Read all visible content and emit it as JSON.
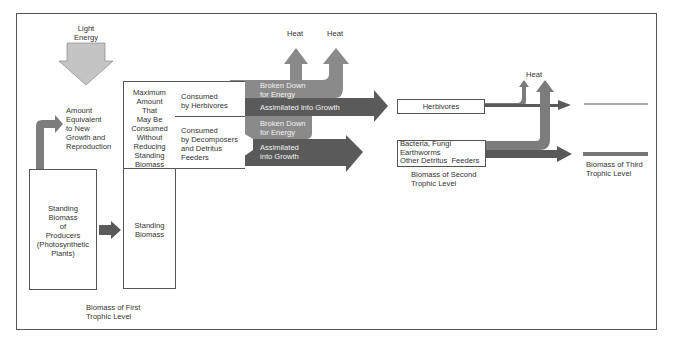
{
  "colors": {
    "light_arrow": "#c4c4c4",
    "broken_down_arrow": "#8a8a8a",
    "assimilated_arrow": "#5a5a5a",
    "growth_arrow": "#7c7c7c",
    "border": "#555555",
    "text": "#333333"
  },
  "input": {
    "light_energy": "Light\nEnergy"
  },
  "producers": {
    "new_growth_label": "Amount\nEquivalent\nto New\nGrowth and\nReproduction",
    "standing_biomass_label": "Standing\nBiomass\nof\nProducers\n(Photosynthetic\nPlants)"
  },
  "first_level_table": {
    "max_consumed_label": "Maximum\nAmount\nThat\nMay Be\nConsumed\nWithout\nReducing\nStanding\nBiomass",
    "herbivores_row": "Consumed\nby Herbivores",
    "decomposers_row": "Consumed\nby Decomposers\nand Detritus\nFeeders",
    "standing_biomass": "Standing\nBiomass",
    "caption": "Biomass of First\nTrophic Level"
  },
  "flows": {
    "herb_broken_down": "Broken Down\nfor Energy",
    "herb_assimilated": "Assimilated into Growth",
    "decomp_broken_down": "Broken Down\nfor Energy",
    "decomp_assimilated": "Assimilated\ninto Growth",
    "heat_1": "Heat",
    "heat_2": "Heat",
    "heat_3": "Heat"
  },
  "second_level": {
    "herbivores": "Herbivores",
    "detritus": "Bacteria, Fungi\nEarthworms\nOther Detritus  Feeders",
    "caption": "Biomass of Second\nTrophic Level"
  },
  "third_level": {
    "caption": "Biomass of Third\nTrophic Level"
  }
}
